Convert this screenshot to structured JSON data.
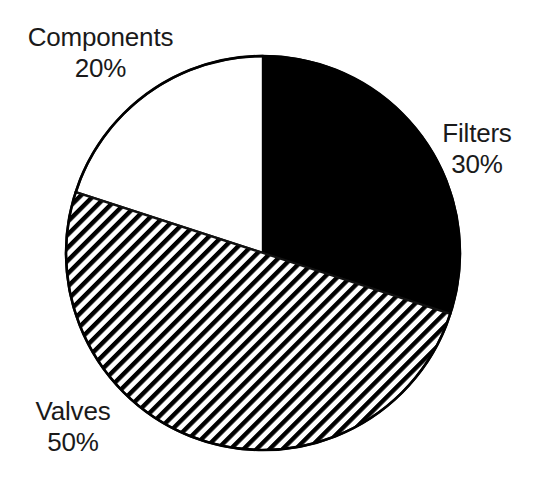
{
  "chart_data": {
    "type": "pie",
    "title": "",
    "subtitle": "",
    "categories": [
      "Filters",
      "Valves",
      "Components"
    ],
    "values": [
      30,
      50,
      20
    ],
    "value_unit": "%",
    "slices": [
      {
        "label": "Filters",
        "value": 30,
        "value_text": "30%",
        "fill": "solid-black",
        "color": "#000000",
        "start_angle_deg": 0,
        "end_angle_deg": 108,
        "label_position": "right"
      },
      {
        "label": "Valves",
        "value": 50,
        "value_text": "50%",
        "fill": "diagonal-hatch",
        "color": "#000000",
        "start_angle_deg": 108,
        "end_angle_deg": 288,
        "label_position": "bottom-left"
      },
      {
        "label": "Components",
        "value": 20,
        "value_text": "20%",
        "fill": "white",
        "color": "#ffffff",
        "start_angle_deg": 288,
        "end_angle_deg": 360,
        "label_position": "top-left"
      }
    ],
    "legend": "labels-outside-slices",
    "grid": false,
    "start_angle_note": "first slice begins at 12 o'clock, drawn clockwise",
    "total": 100,
    "xlabel": "",
    "ylabel": ""
  },
  "figure": {
    "background_color": "#ffffff",
    "outline_color": "#000000",
    "text_color": "#1a1a1a",
    "center_x": 263,
    "center_y": 253,
    "radius": 197
  },
  "labels": {
    "components": {
      "name": "Components",
      "value": "20%"
    },
    "filters": {
      "name": "Filters",
      "value": "30%"
    },
    "valves": {
      "name": "Valves",
      "value": "50%"
    }
  }
}
